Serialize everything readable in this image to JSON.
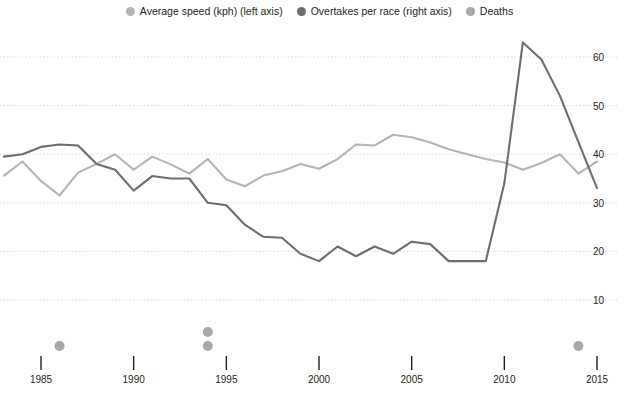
{
  "legend": {
    "position": "top-center",
    "entries": [
      {
        "label": "Average speed (kph) (left axis)",
        "icon": "legend-dot-icon",
        "color": "#b4b4b4"
      },
      {
        "label": "Overtakes per race (right axis)",
        "icon": "legend-dot-icon",
        "color": "#6e6e6e"
      },
      {
        "label": "Deaths",
        "icon": "legend-dot-icon",
        "color": "#a8a8a8"
      }
    ]
  },
  "axes": {
    "y_right_ticks": [
      "10",
      "20",
      "30",
      "40",
      "50",
      "60"
    ],
    "x_ticks": [
      "1985",
      "1990",
      "1995",
      "2000",
      "2005",
      "2010",
      "2015"
    ]
  },
  "chart_data": {
    "type": "line",
    "title": "",
    "subtitle": "",
    "xlabel": "",
    "ylabel": "",
    "grid": true,
    "legend_position": "top-center",
    "xlim": [
      1983,
      2015
    ],
    "x": [
      1983,
      1984,
      1985,
      1986,
      1987,
      1988,
      1989,
      1990,
      1991,
      1992,
      1993,
      1994,
      1995,
      1996,
      1997,
      1998,
      1999,
      2000,
      2001,
      2002,
      2003,
      2004,
      2005,
      2006,
      2007,
      2008,
      2009,
      2010,
      2011,
      2012,
      2013,
      2014,
      2015
    ],
    "y_right_lim": [
      5.5,
      64.5
    ],
    "series": [
      {
        "name": "Average speed (kph) (left axis)",
        "axis": "left",
        "color": "#b4b4b4",
        "values": [
          35.6,
          38.5,
          34.5,
          31.5,
          36.2,
          38.0,
          40.0,
          36.8,
          39.5,
          37.9,
          36.0,
          39.0,
          34.8,
          33.4,
          35.6,
          36.5,
          38.0,
          37.0,
          39.0,
          42.0,
          41.8,
          44.0,
          43.5,
          42.4,
          41.0,
          40.0,
          39.0,
          38.3,
          36.8,
          38.2,
          40.0,
          36.0,
          38.5
        ]
      },
      {
        "name": "Overtakes per race (right axis)",
        "axis": "right",
        "color": "#6e6e6e",
        "values": [
          39.5,
          40.0,
          41.5,
          42.0,
          41.8,
          38.0,
          36.8,
          32.5,
          35.5,
          35.0,
          35.0,
          30.0,
          29.5,
          25.5,
          23.0,
          22.8,
          19.5,
          18.0,
          21.0,
          19.0,
          21.0,
          19.5,
          22.0,
          21.5,
          18.0,
          18.0,
          18.0,
          34.0,
          63.0,
          59.5,
          52.0,
          42.5,
          33.0
        ]
      }
    ],
    "deaths": {
      "name": "Deaths",
      "color": "#a8a8a8",
      "points": [
        {
          "year": 1986,
          "count": 1
        },
        {
          "year": 1994,
          "count": 2
        },
        {
          "year": 2014,
          "count": 1
        }
      ]
    }
  }
}
